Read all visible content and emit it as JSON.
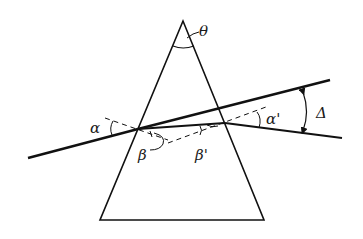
{
  "diagram": {
    "type": "prism-refraction",
    "labels": {
      "apex_angle": "θ",
      "incidence_angle": "α",
      "refraction_angle_entry": "β",
      "refraction_angle_exit": "β'",
      "emergence_angle": "α'",
      "deviation_angle": "Δ"
    },
    "colors": {
      "line": "#111111",
      "background": "#ffffff"
    }
  }
}
